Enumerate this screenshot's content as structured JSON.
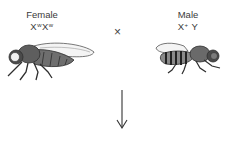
{
  "parents": {
    "female": {
      "sex_label": "Female",
      "genotype": {
        "allele1": "X",
        "sup1": "w",
        "allele2": "X",
        "sup2": "w"
      },
      "icon": "fruit-fly-female-icon"
    },
    "cross_symbol": "×",
    "male": {
      "sex_label": "Male",
      "genotype": {
        "allele1": "X",
        "sup1": "+",
        "allele2": " Y"
      },
      "icon": "fruit-fly-male-icon"
    }
  },
  "arrow": {
    "direction": "down",
    "icon": "down-arrow-icon"
  },
  "colors": {
    "fly_body": "#6e6e6e",
    "fly_dark": "#2e2e2e",
    "wing": "#f4f4f4",
    "text": "#3a3a3a"
  }
}
